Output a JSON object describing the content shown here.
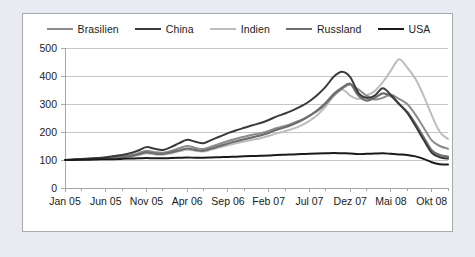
{
  "chart_data": {
    "type": "line",
    "title": "",
    "subtitle": "",
    "xlabel": "",
    "ylabel": "",
    "ylim": [
      0,
      500
    ],
    "yticks": [
      "0",
      "100",
      "200",
      "300",
      "400",
      "500"
    ],
    "grid": true,
    "legend_position": "top",
    "xticks": [
      "Jan 05",
      "Jun 05",
      "Nov 05",
      "Apr 06",
      "Sep 06",
      "Feb 07",
      "Jul 07",
      "Dez 07",
      "Mai 08",
      "Okt 08"
    ],
    "x": [
      "Jan 05",
      "Feb 05",
      "Mrz 05",
      "Apr 05",
      "Mai 05",
      "Jun 05",
      "Jul 05",
      "Aug 05",
      "Sep 05",
      "Okt 05",
      "Nov 05",
      "Dez 05",
      "Jan 06",
      "Feb 06",
      "Mrz 06",
      "Apr 06",
      "Mai 06",
      "Jun 06",
      "Jul 06",
      "Aug 06",
      "Sep 06",
      "Okt 06",
      "Nov 06",
      "Dez 06",
      "Jan 07",
      "Feb 07",
      "Mrz 07",
      "Apr 07",
      "Mai 07",
      "Jun 07",
      "Jul 07",
      "Aug 07",
      "Sep 07",
      "Okt 07",
      "Nov 07",
      "Dez 07",
      "Jan 08",
      "Feb 08",
      "Mrz 08",
      "Apr 08",
      "Mai 08",
      "Jun 08",
      "Jul 08",
      "Aug 08",
      "Sep 08",
      "Okt 08",
      "Nov 08",
      "Dez 08"
    ],
    "series": [
      {
        "name": "Brasilien",
        "color": "#8c8c8c",
        "width": 2.0,
        "values": [
          100,
          101,
          103,
          104,
          106,
          108,
          110,
          112,
          116,
          124,
          133,
          128,
          126,
          132,
          142,
          150,
          143,
          139,
          148,
          158,
          168,
          176,
          183,
          190,
          196,
          204,
          214,
          222,
          232,
          243,
          258,
          276,
          300,
          330,
          355,
          370,
          352,
          330,
          316,
          322,
          333,
          318,
          300,
          262,
          216,
          170,
          150,
          140
        ]
      },
      {
        "name": "China",
        "color": "#3a3a3a",
        "width": 2.0,
        "values": [
          100,
          102,
          104,
          105,
          107,
          110,
          114,
          118,
          124,
          134,
          146,
          140,
          136,
          146,
          160,
          172,
          165,
          160,
          172,
          184,
          196,
          206,
          215,
          224,
          232,
          243,
          256,
          266,
          278,
          292,
          310,
          333,
          362,
          398,
          415,
          396,
          340,
          322,
          330,
          356,
          332,
          300,
          268,
          222,
          172,
          126,
          110,
          105
        ]
      },
      {
        "name": "Indien",
        "color": "#bdbdbd",
        "width": 2.0,
        "values": [
          100,
          100,
          102,
          103,
          104,
          106,
          107,
          109,
          112,
          118,
          124,
          120,
          119,
          124,
          131,
          137,
          133,
          130,
          137,
          145,
          153,
          160,
          166,
          172,
          178,
          186,
          195,
          203,
          212,
          224,
          240,
          262,
          292,
          330,
          352,
          330,
          318,
          330,
          346,
          378,
          420,
          460,
          430,
          390,
          330,
          260,
          200,
          175
        ]
      },
      {
        "name": "Russland",
        "color": "#6e6e6e",
        "width": 2.2,
        "values": [
          100,
          101,
          102,
          104,
          105,
          107,
          109,
          111,
          114,
          120,
          127,
          123,
          122,
          127,
          134,
          141,
          136,
          133,
          141,
          150,
          159,
          167,
          174,
          181,
          188,
          197,
          208,
          217,
          228,
          241,
          258,
          278,
          304,
          336,
          358,
          372,
          330,
          312,
          322,
          338,
          328,
          300,
          272,
          230,
          182,
          135,
          118,
          112
        ]
      },
      {
        "name": "USA",
        "color": "#1a1a1a",
        "width": 2.0,
        "values": [
          100,
          100,
          101,
          101,
          102,
          103,
          103,
          104,
          105,
          106,
          107,
          106,
          106,
          107,
          108,
          109,
          108,
          108,
          109,
          110,
          111,
          112,
          113,
          114,
          115,
          116,
          118,
          119,
          120,
          121,
          122,
          123,
          124,
          125,
          124,
          123,
          121,
          122,
          123,
          124,
          122,
          120,
          118,
          113,
          104,
          92,
          85,
          84
        ]
      }
    ]
  },
  "legend": {
    "items": [
      {
        "label": "Brasilien",
        "color": "#8c8c8c",
        "width": 2
      },
      {
        "label": "China",
        "color": "#3a3a3a",
        "width": 2
      },
      {
        "label": "Indien",
        "color": "#bdbdbd",
        "width": 2
      },
      {
        "label": "Russland",
        "color": "#6e6e6e",
        "width": 2
      },
      {
        "label": "USA",
        "color": "#1a1a1a",
        "width": 2
      }
    ]
  }
}
